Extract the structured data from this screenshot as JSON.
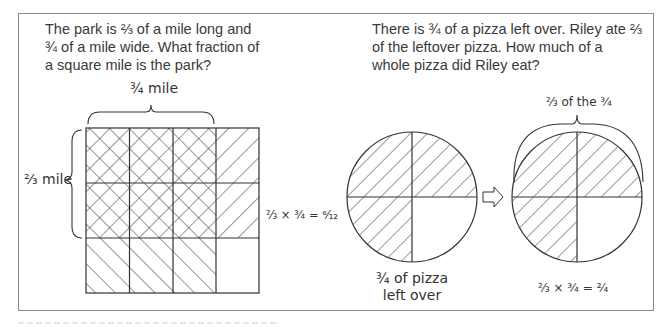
{
  "left_panel": {
    "question": "The park is ⅔ of a mile long and ¾ of a mile wide. What fraction of a square mile is the park?",
    "width_label": "¾ mile",
    "length_label": "⅔ mile",
    "equation": "⅔ × ¾ = ⁶⁄₁₂",
    "grid": {
      "columns": 4,
      "rows": 3,
      "crosshatched_cells": 6,
      "total_cells": 12
    }
  },
  "right_panel": {
    "question": "There is ¾ of a pizza left over. Riley ate ⅔ of the leftover pizza. How much of a whole pizza did Riley eat?",
    "left_circle_caption_line1": "¾ of pizza",
    "left_circle_caption_line2": "left over",
    "brace_label": "⅔ of the ¾",
    "equation": "⅔ × ¾ = ²⁄₄",
    "arrow_icon": "right-arrow-icon"
  },
  "colors": {
    "line": "#333333",
    "border": "#8a8a8a",
    "text": "#3a3a3a"
  }
}
